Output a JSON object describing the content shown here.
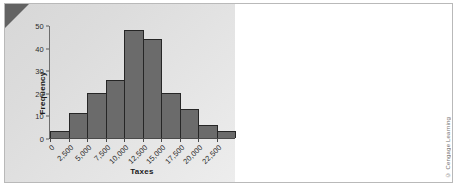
{
  "figure": {
    "attribution": "© Cengage Learning",
    "panel_color": "#dcdcdc",
    "bar_color": "#6b6b6b",
    "bar_border_color": "#262626",
    "corner_color": "#636363"
  },
  "chart_data": {
    "type": "bar",
    "title": "",
    "xlabel": "Taxes",
    "ylabel": "Frequency",
    "categories": [
      "0",
      "2,500",
      "5,000",
      "7,500",
      "10,000",
      "12,500",
      "15,000",
      "17,500",
      "20,000",
      "22,500"
    ],
    "values": [
      3,
      11,
      20,
      26,
      48,
      44,
      20,
      13,
      6,
      3
    ],
    "ylim": [
      0,
      50
    ],
    "yticks": [
      0,
      10,
      20,
      30,
      40,
      50
    ],
    "ytick_labels": [
      "0",
      "10",
      "20",
      "30",
      "40",
      "50"
    ],
    "xtick_labels": [
      "0",
      "2,500",
      "5,000",
      "7,500",
      "10,000",
      "12,500",
      "15,000",
      "17,500",
      "20,000",
      "22,500"
    ],
    "grid": false,
    "legend": null
  }
}
